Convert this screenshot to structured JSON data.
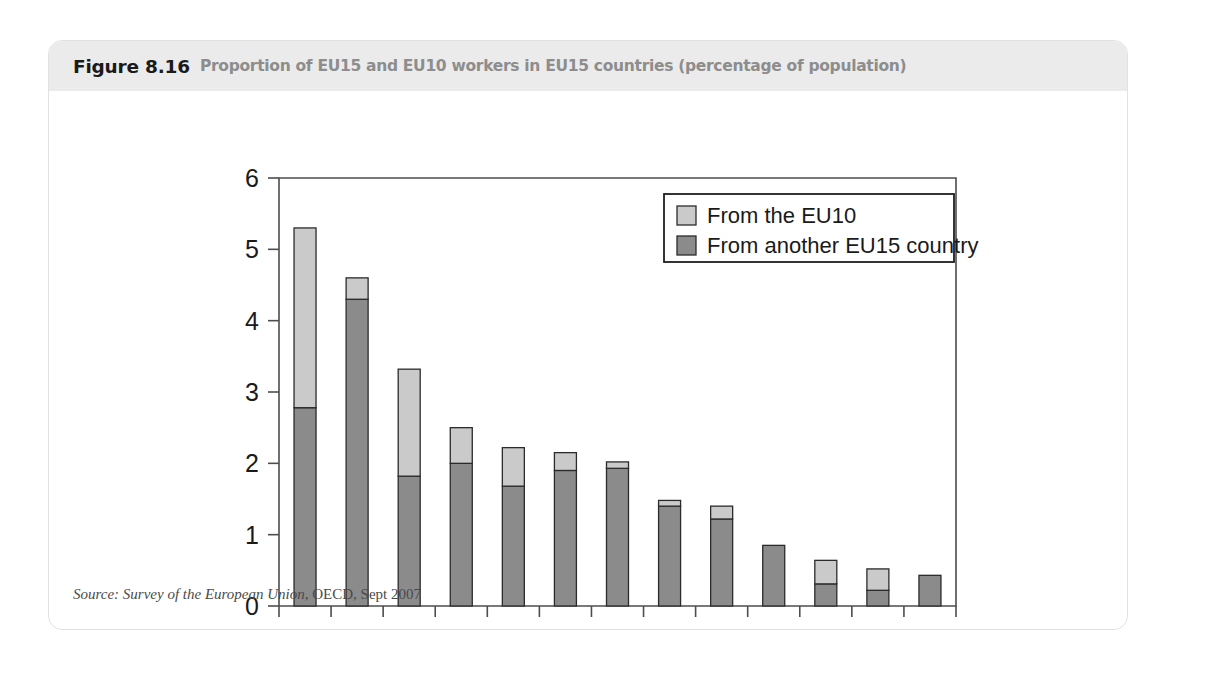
{
  "figure": {
    "number": "Figure 8.16",
    "caption": "Proportion of EU15 and EU10 workers in EU15 countries (percentage of population)",
    "source_label": "Source: ",
    "source_title": "Survey of the European Union",
    "source_rest": ", OECD, Sept 2007"
  },
  "colors": {
    "eu10": "#cacaca",
    "eu15": "#8b8b8b",
    "axis": "#4d4d4d",
    "header_band": "#ebebeb",
    "caption_grey": "#8d8d8d"
  },
  "chart_data": {
    "type": "bar",
    "stacked": true,
    "title": "Proportion of EU15 and EU10 workers in EU15 countries (percentage of population)",
    "xlabel": "",
    "ylabel": "",
    "ylim": [
      0,
      6
    ],
    "yticks": [
      0,
      1,
      2,
      3,
      4,
      5,
      6
    ],
    "ytick_labels": [
      "0",
      "1",
      "2",
      "3",
      "4",
      "5",
      "6"
    ],
    "grid": false,
    "legend_position": "top-right",
    "categories": [
      "IRL",
      "BEL",
      "AUT",
      "DEU",
      "GBR",
      "SWE",
      "FRA",
      "NLD",
      "ESP",
      "DNK",
      "FIN",
      "GRC",
      "PRT"
    ],
    "series": [
      {
        "name": "From another EU15 country",
        "color": "#8b8b8b",
        "values": [
          2.78,
          4.3,
          1.82,
          2.0,
          1.68,
          1.9,
          1.93,
          1.4,
          1.22,
          0.85,
          0.31,
          0.22,
          0.43
        ]
      },
      {
        "name": "From the EU10",
        "color": "#cacaca",
        "values": [
          2.52,
          0.3,
          1.5,
          0.5,
          0.54,
          0.25,
          0.09,
          0.08,
          0.18,
          0.0,
          0.33,
          0.3,
          0.0
        ]
      }
    ],
    "totals": [
      5.3,
      4.6,
      3.32,
      2.5,
      2.22,
      2.15,
      2.02,
      1.48,
      1.4,
      0.85,
      0.64,
      0.52,
      0.43
    ],
    "legend": [
      {
        "label": "From the EU10",
        "color": "#cacaca"
      },
      {
        "label": "From another EU15 country",
        "color": "#8b8b8b"
      }
    ]
  }
}
